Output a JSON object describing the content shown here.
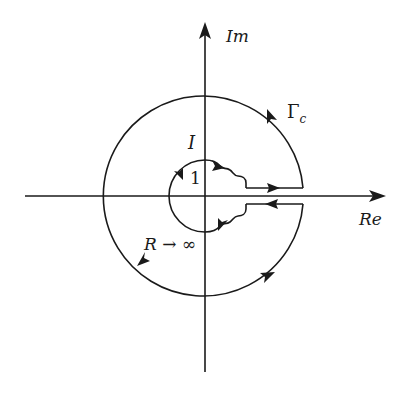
{
  "diagram": {
    "type": "contour-diagram",
    "axes": {
      "real_label": "Re",
      "imag_label": "Im"
    },
    "labels": {
      "contour": "Γ",
      "contour_sub": "c",
      "inner_region": "I",
      "inner_radius": "1",
      "outer_radius": "R → ∞"
    },
    "colors": {
      "stroke": "#1a1a1a",
      "background": "#ffffff"
    }
  }
}
